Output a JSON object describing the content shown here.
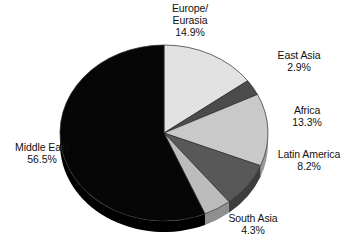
{
  "chart_data": {
    "type": "pie",
    "title": "",
    "subtitle": "",
    "xlabel": "",
    "ylabel": "",
    "legend_position": "none",
    "grid": false,
    "labels_outside": true,
    "start_angle_deg": 0,
    "direction": "clockwise",
    "categories": [
      "Europe/Eurasia",
      "East Asia",
      "Africa",
      "Latin America",
      "South Asia",
      "Middle East"
    ],
    "values": [
      14.9,
      2.9,
      13.3,
      8.2,
      4.3,
      56.5
    ],
    "unit": "%",
    "slices": [
      {
        "name": "Europe/\nEurasia",
        "name_line1": "Europe/",
        "name_line2": "Eurasia",
        "value": 14.9,
        "value_label": "14.9%",
        "color": "#e2e2e2",
        "side_color": "#b4b4b4"
      },
      {
        "name": "East Asia",
        "name_line1": "East Asia",
        "name_line2": "",
        "value": 2.9,
        "value_label": "2.9%",
        "color": "#4b4b4b",
        "side_color": "#343434"
      },
      {
        "name": "Africa",
        "name_line1": "Africa",
        "name_line2": "",
        "value": 13.3,
        "value_label": "13.3%",
        "color": "#c9c9c9",
        "side_color": "#9a9a9a"
      },
      {
        "name": "Latin America",
        "name_line1": "Latin America",
        "name_line2": "",
        "value": 8.2,
        "value_label": "8.2%",
        "color": "#585858",
        "side_color": "#3d3d3d"
      },
      {
        "name": "South Asia",
        "name_line1": "South Asia",
        "name_line2": "",
        "value": 4.3,
        "value_label": "4.3%",
        "color": "#bcbcbc",
        "side_color": "#8f8f8f"
      },
      {
        "name": "Middle East",
        "name_line1": "Middle East",
        "name_line2": "",
        "value": 56.5,
        "value_label": "56.5%",
        "color": "#060606",
        "side_color": "#000000"
      }
    ]
  },
  "labels": {
    "europe": {
      "line1": "Europe/",
      "line2": "Eurasia",
      "value": "14.9%"
    },
    "east_asia": {
      "line1": "East Asia",
      "value": "2.9%"
    },
    "africa": {
      "line1": "Africa",
      "value": "13.3%"
    },
    "latin_america": {
      "line1": "Latin America",
      "value": "8.2%"
    },
    "south_asia": {
      "line1": "South Asia",
      "value": "4.3%"
    },
    "middle_east": {
      "line1": "Middle East",
      "value": "56.5%"
    }
  }
}
